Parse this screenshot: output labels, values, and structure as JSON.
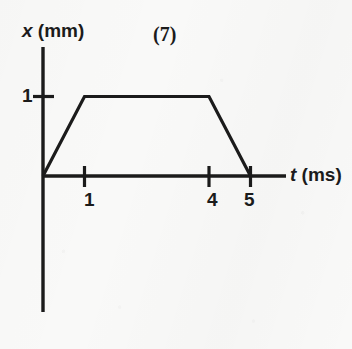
{
  "figure": {
    "number_label": "(7)",
    "y_axis": {
      "variable": "x",
      "unit": "(mm)",
      "tick_label_1": "1"
    },
    "x_axis": {
      "variable": "t",
      "unit": "(ms)",
      "tick_label_1": "1",
      "tick_label_4": "4",
      "tick_label_5": "5"
    },
    "colors": {
      "ink": "#1b1b1b",
      "paper": "#f9f9f8"
    }
  },
  "chart_data": {
    "type": "line",
    "title": "(7)",
    "xlabel": "t (ms)",
    "ylabel": "x (mm)",
    "x": [
      0,
      1,
      4,
      5
    ],
    "y": [
      0,
      1,
      1,
      0
    ],
    "series": [
      {
        "name": "x(t)",
        "x": [
          0,
          1,
          4,
          5
        ],
        "values": [
          0,
          1,
          1,
          0
        ]
      }
    ],
    "xlim": [
      0,
      5.7
    ],
    "ylim": [
      0,
      1.65
    ],
    "xticks": [
      1,
      4,
      5
    ],
    "yticks": [
      1
    ],
    "xtick_labels": [
      "1",
      "4",
      "5"
    ],
    "ytick_labels": [
      "1"
    ],
    "grid": false,
    "legend": null,
    "annotations": []
  }
}
